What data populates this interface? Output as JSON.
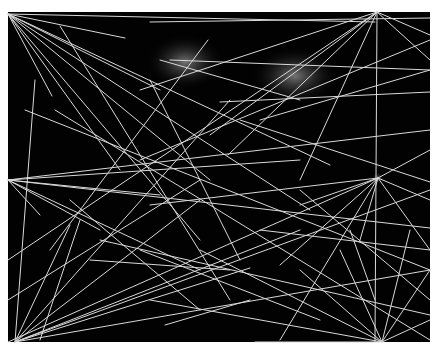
{
  "artwork": {
    "description": "Abstract composition of thin white lines radiating from several focal points across a black field",
    "colors": {
      "page_background": "#ffffff",
      "canvas": "#020202",
      "line": "#d9d9d9",
      "glow": "#8a8a8a"
    },
    "canvas": {
      "x": 8,
      "y": 12,
      "width": 422,
      "height": 330
    },
    "glows": [
      {
        "cx": 185,
        "cy": 62,
        "rx": 40,
        "ry": 28
      },
      {
        "cx": 295,
        "cy": 76,
        "rx": 45,
        "ry": 30
      },
      {
        "cx": 378,
        "cy": 178,
        "rx": 6,
        "ry": 6
      }
    ],
    "lines": [
      [
        8,
        14,
        375,
        22
      ],
      [
        8,
        14,
        125,
        38
      ],
      [
        8,
        14,
        52,
        96
      ],
      [
        8,
        14,
        120,
        170
      ],
      [
        8,
        14,
        200,
        240
      ],
      [
        8,
        14,
        160,
        90
      ],
      [
        8,
        14,
        210,
        180
      ],
      [
        8,
        14,
        310,
        210
      ],
      [
        8,
        14,
        330,
        165
      ],
      [
        150,
        22,
        430,
        18
      ],
      [
        377,
        12,
        8,
        260
      ],
      [
        377,
        12,
        140,
        90
      ],
      [
        377,
        12,
        300,
        180
      ],
      [
        377,
        12,
        375,
        342
      ],
      [
        377,
        12,
        430,
        60
      ],
      [
        377,
        12,
        430,
        35
      ],
      [
        377,
        12,
        228,
        155
      ],
      [
        377,
        12,
        210,
        135
      ],
      [
        430,
        40,
        140,
        160
      ],
      [
        60,
        26,
        230,
        300
      ],
      [
        208,
        40,
        50,
        250
      ],
      [
        220,
        102,
        430,
        92
      ],
      [
        170,
        60,
        430,
        70
      ],
      [
        260,
        120,
        430,
        70
      ],
      [
        160,
        60,
        300,
        100
      ],
      [
        8,
        180,
        430,
        228
      ],
      [
        8,
        180,
        430,
        130
      ],
      [
        8,
        180,
        300,
        160
      ],
      [
        8,
        180,
        160,
        195
      ],
      [
        8,
        180,
        100,
        230
      ],
      [
        8,
        180,
        200,
        270
      ],
      [
        8,
        180,
        40,
        215
      ],
      [
        378,
        178,
        8,
        342
      ],
      [
        378,
        178,
        150,
        205
      ],
      [
        378,
        178,
        280,
        340
      ],
      [
        378,
        178,
        430,
        150
      ],
      [
        378,
        178,
        430,
        250
      ],
      [
        378,
        178,
        280,
        265
      ],
      [
        378,
        178,
        300,
        205
      ],
      [
        378,
        178,
        430,
        200
      ],
      [
        378,
        178,
        360,
        240
      ],
      [
        15,
        342,
        230,
        100
      ],
      [
        15,
        342,
        430,
        190
      ],
      [
        15,
        342,
        300,
        230
      ],
      [
        15,
        342,
        200,
        200
      ],
      [
        15,
        342,
        70,
        225
      ],
      [
        15,
        342,
        35,
        80
      ],
      [
        15,
        342,
        430,
        270
      ],
      [
        15,
        342,
        250,
        268
      ],
      [
        382,
        342,
        300,
        270
      ],
      [
        382,
        342,
        430,
        320
      ],
      [
        382,
        342,
        430,
        270
      ],
      [
        382,
        342,
        150,
        300
      ],
      [
        382,
        342,
        200,
        250
      ],
      [
        382,
        342,
        410,
        230
      ],
      [
        382,
        342,
        340,
        250
      ],
      [
        382,
        342,
        255,
        342
      ],
      [
        70,
        200,
        200,
        310
      ],
      [
        90,
        260,
        230,
        270
      ],
      [
        140,
        250,
        320,
        320
      ],
      [
        165,
        325,
        250,
        300
      ],
      [
        240,
        120,
        430,
        182
      ],
      [
        300,
        190,
        430,
        300
      ],
      [
        350,
        230,
        375,
        300
      ],
      [
        25,
        110,
        430,
        270
      ],
      [
        40,
        340,
        80,
        220
      ],
      [
        150,
        80,
        240,
        260
      ],
      [
        100,
        240,
        430,
        315
      ],
      [
        260,
        230,
        430,
        250
      ],
      [
        8,
        300,
        200,
        180
      ],
      [
        55,
        110,
        430,
        340
      ]
    ]
  }
}
